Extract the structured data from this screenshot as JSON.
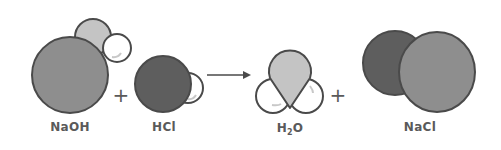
{
  "diagram": {
    "operators": {
      "plus": "+",
      "arrow": "→"
    },
    "molecules": [
      {
        "id": "naoh",
        "label": "NaOH",
        "atoms": [
          "Na",
          "O",
          "H"
        ]
      },
      {
        "id": "hcl",
        "label": "HCl",
        "atoms": [
          "Cl",
          "H"
        ]
      },
      {
        "id": "h2o",
        "label_main": "H",
        "label_sub": "2",
        "label_end": "O",
        "atoms": [
          "O",
          "H",
          "H"
        ]
      },
      {
        "id": "nacl",
        "label": "NaCl",
        "atoms": [
          "Cl",
          "Na"
        ]
      }
    ],
    "colors": {
      "sodium": "#8e8e8e",
      "oxygen": "#c4c4c4",
      "hydrogen": "#ffffff",
      "chlorine": "#5e5e5e",
      "outline": "#4a4a4a",
      "text": "#5a5a5a"
    }
  }
}
